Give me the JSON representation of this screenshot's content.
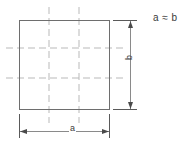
{
  "diagram": {
    "type": "engineering-dimension-drawing",
    "colors": {
      "outline": "#6e6e6e",
      "centerline": "#b9b9b9",
      "dimension": "#5a5a5a",
      "text": "#3a3a3a",
      "background": "#ffffff"
    },
    "shape": {
      "name": "square",
      "left": 19,
      "top": 20,
      "width": 91,
      "height": 90
    },
    "centerlines": {
      "vertical_x": [
        49,
        79
      ],
      "horizontal_y": [
        48,
        78
      ],
      "style": "dashed",
      "overhang": 14
    },
    "annotations": {
      "relation_label": "a ≈ b",
      "height_label": "b",
      "width_label": "a"
    },
    "dimensions": [
      {
        "name": "height-dimension",
        "label": "b",
        "orientation": "vertical",
        "line_x": 130,
        "from_y": 20,
        "to_y": 110,
        "extension_from_x": 113,
        "extension_to_x": 137
      },
      {
        "name": "width-dimension",
        "label": "a",
        "orientation": "horizontal",
        "line_y": 131,
        "from_x": 19,
        "to_x": 110,
        "extension_from_y": 114,
        "extension_to_y": 138
      }
    ]
  }
}
